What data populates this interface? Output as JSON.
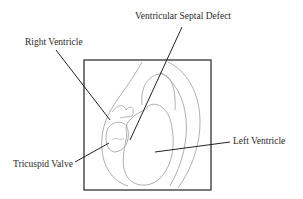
{
  "diagram": {
    "labels": {
      "vsd": "Ventricular Septal Defect",
      "right_ventricle": "Right Ventricle",
      "tricuspid_valve": "Tricuspid Valve",
      "left_ventricle": "Left Ventricle"
    },
    "colors": {
      "frame": "#333333",
      "leader": "#222222",
      "outline": "#9a9a9a",
      "text": "#2a2a2a"
    }
  }
}
